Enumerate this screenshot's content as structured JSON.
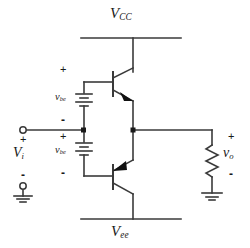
{
  "diagram": {
    "type": "circuit-schematic",
    "stroke_color": "#3a3a3a",
    "text_color": "#1a1a1a",
    "background": "#ffffff",
    "width": 250,
    "height": 248
  },
  "rails": {
    "top": {
      "label_main": "V",
      "label_sub": "CC"
    },
    "bottom": {
      "label_main": "V",
      "label_sub": "ee"
    }
  },
  "sources": {
    "input": {
      "label_main": "V",
      "label_sub": "i",
      "plus": "+",
      "minus": "-"
    },
    "output": {
      "label_main": "v",
      "label_sub": "o",
      "plus": "+",
      "minus": "-"
    }
  },
  "bias": {
    "upper": {
      "label_main": "v",
      "label_sub": "be",
      "plus": "+",
      "minus": "-"
    },
    "lower": {
      "label_main": "v",
      "label_sub": "be",
      "plus": "+",
      "minus": "-"
    }
  },
  "components": {
    "npn": "npn-transistor",
    "pnp": "pnp-transistor",
    "resistor": "load-resistor",
    "ground_input": "ground-symbol",
    "ground_output": "ground-symbol",
    "terminal_input_top": "open-terminal",
    "terminal_input_bottom": "open-terminal"
  }
}
